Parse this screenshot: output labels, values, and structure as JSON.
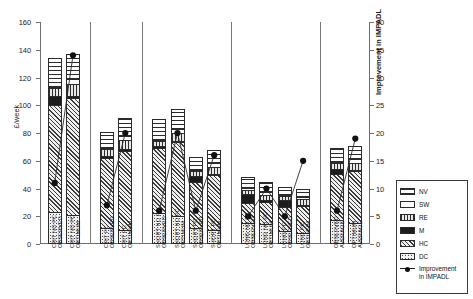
{
  "chart_data": {
    "type": "bar",
    "subtype": "stacked-bar-with-line-overlay",
    "title": "",
    "xlabel": "",
    "ylabel": "£/week",
    "ylim": [
      0,
      160
    ],
    "ytick_step": 20,
    "yticks": [
      0,
      20,
      40,
      60,
      80,
      100,
      120,
      140,
      160
    ],
    "y2label": "Improvement in IMPADL",
    "y2lim": [
      0,
      40
    ],
    "y2tick_step": 5,
    "y2ticks": [
      0,
      5,
      10,
      15,
      20,
      25,
      30,
      35,
      40
    ],
    "grid": false,
    "legend_position": "right",
    "categories": [
      "CRIT NO PC\nOBSERVED",
      "CRIT NO PC\nOPTIMUM",
      "CRIT PC\nOBSERVED",
      "CRIT PC\nOPTIMUM",
      "SHORT NO PC\nOBSERVED",
      "SHORT NO PC\nOPTIMUM",
      "SHORT PC\nOBSERVED",
      "SHORT PC\nOPTIMUM",
      "LONG NO PC\nOBSERVED",
      "LONG NO PC\nOPTIMUM",
      "LONG PC\nOBSERVED",
      "LONG PC\nOPTIMUM",
      "OBSERVED\nAVERAGE",
      "OPTIMUM\nAVERAGE"
    ],
    "group_separators_after": [
      1,
      3,
      7,
      11
    ],
    "series": [
      {
        "name": "DC",
        "values": [
          22,
          20,
          10,
          9,
          21,
          19,
          10,
          9,
          14,
          13,
          8,
          7,
          16,
          14
        ]
      },
      {
        "name": "HC",
        "values": [
          78,
          85,
          52,
          58,
          48,
          54,
          34,
          40,
          15,
          17,
          18,
          20,
          34,
          38
        ]
      },
      {
        "name": "M",
        "values": [
          6,
          1,
          1,
          1,
          1,
          1,
          5,
          1,
          7,
          1,
          5,
          1,
          4,
          1
        ]
      },
      {
        "name": "RE",
        "values": [
          6,
          9,
          5,
          7,
          4,
          6,
          3,
          5,
          3,
          4,
          3,
          4,
          4,
          5
        ]
      },
      {
        "name": "SW",
        "values": [
          1,
          4,
          1,
          3,
          1,
          3,
          1,
          3,
          1,
          2,
          1,
          2,
          1,
          3
        ]
      },
      {
        "name": "NV",
        "values": [
          21,
          18,
          12,
          13,
          15,
          14,
          10,
          10,
          8,
          8,
          6,
          6,
          10,
          10
        ]
      }
    ],
    "totals": [
      134,
      137,
      81,
      91,
      90,
      97,
      63,
      68,
      48,
      45,
      41,
      40,
      69,
      71
    ],
    "line_series": {
      "name": "Improvement in IMPADL",
      "values": [
        11,
        34,
        7,
        20,
        6,
        20,
        6,
        16,
        5,
        10,
        5,
        15,
        6,
        19
      ]
    }
  },
  "legend": {
    "items": [
      {
        "key": "NV",
        "label": "NV"
      },
      {
        "key": "SW",
        "label": "SW"
      },
      {
        "key": "RE",
        "label": "RE"
      },
      {
        "key": "M",
        "label": "M"
      },
      {
        "key": "HC",
        "label": "HC"
      },
      {
        "key": "DC",
        "label": "DC"
      }
    ],
    "line_label_line1": "Improvement",
    "line_label_line2": "in IMPADL"
  },
  "axes": {
    "y_left_label": "£/week",
    "y_right_label": "Improvement in IMPADL",
    "y_left_ticks": [
      "0",
      "20",
      "40",
      "60",
      "80",
      "100",
      "120",
      "140",
      "160"
    ],
    "y_right_ticks": [
      "0",
      "5",
      "10",
      "15",
      "20",
      "25",
      "30",
      "35",
      "40"
    ]
  }
}
